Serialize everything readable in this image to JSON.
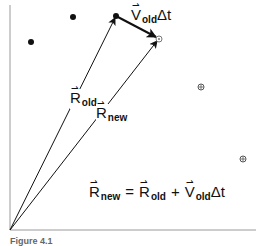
{
  "diagram": {
    "type": "vector-position-update",
    "axes": {
      "origin": [
        10,
        230
      ],
      "x_end": 256,
      "y_top": 5,
      "color": "#9a9a9a"
    },
    "points": {
      "filled": [
        [
          31,
          42
        ],
        [
          73,
          17
        ],
        [
          116,
          16
        ]
      ],
      "hollow": [
        [
          159,
          39
        ],
        [
          201,
          87
        ],
        [
          243,
          159
        ]
      ]
    },
    "vectors": [
      {
        "name": "R_old",
        "from": [
          10,
          230
        ],
        "to": [
          116,
          16
        ]
      },
      {
        "name": "R_new",
        "from": [
          10,
          230
        ],
        "to": [
          159,
          39
        ]
      },
      {
        "name": "V_old_dt",
        "from": [
          116,
          16
        ],
        "to": [
          159,
          39
        ],
        "bold": true
      }
    ],
    "labels": {
      "r_old": {
        "symbol": "R",
        "sub": "old"
      },
      "r_new": {
        "symbol": "R",
        "sub": "new"
      },
      "v_dt": {
        "symbol": "V",
        "sub": "old",
        "suffix": "Δt"
      },
      "vec_mark": "⇀"
    },
    "equation": {
      "lhs_symbol": "R",
      "lhs_sub": "new",
      "equals": "=",
      "term1_symbol": "R",
      "term1_sub": "old",
      "plus": "+",
      "term2_symbol": "V",
      "term2_sub": "old",
      "term2_suffix": "Δt"
    },
    "caption": "Figure 4.1"
  }
}
